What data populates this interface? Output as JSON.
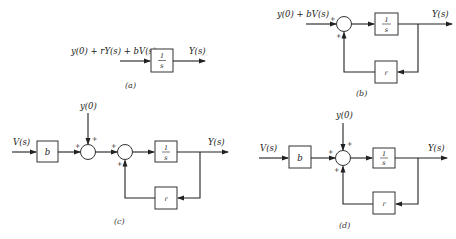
{
  "diagrams": {
    "a": {
      "input_label": "y(0) + rY(s) + bV(s)",
      "block": {
        "num": "1",
        "den": "s"
      },
      "output_label": "Y(s)",
      "caption": "(a)"
    },
    "b": {
      "input_label": "y(0) + bV(s)",
      "sum_signs": [
        "+",
        "+"
      ],
      "forward_block": {
        "num": "1",
        "den": "s"
      },
      "feedback_block": "r",
      "output_label": "Y(s)",
      "caption": "(b)"
    },
    "c": {
      "input_label": "V(s)",
      "gain_block": "b",
      "initial_label": "y(0)",
      "sum1_signs": [
        "+",
        "+"
      ],
      "sum2_signs": [
        "+",
        "+"
      ],
      "forward_block": {
        "num": "1",
        "den": "s"
      },
      "feedback_block": "r",
      "output_label": "Y(s)",
      "caption": "(c)"
    },
    "d": {
      "input_label": "V(s)",
      "gain_block": "b",
      "initial_label": "y(0)",
      "sum_signs": [
        "+",
        "+",
        "+"
      ],
      "forward_block": {
        "num": "1",
        "den": "s"
      },
      "feedback_block": "r",
      "output_label": "Y(s)",
      "caption": "(d)"
    }
  }
}
